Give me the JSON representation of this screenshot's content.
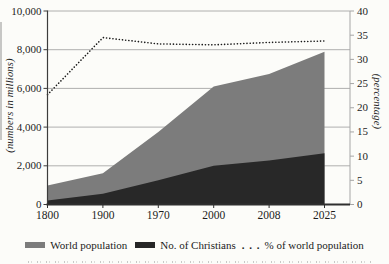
{
  "figure": {
    "legend": {
      "items": [
        {
          "label": "World population"
        },
        {
          "label": "No. of Christians"
        },
        {
          "marker": ". . .",
          "label": "% of world population"
        }
      ]
    }
  },
  "chart_data": {
    "type": "area",
    "title": "",
    "categories": [
      "1800",
      "1900",
      "1970",
      "2000",
      "2008",
      "2025"
    ],
    "series": [
      {
        "name": "World population",
        "type": "area",
        "axis": "left",
        "color": "#7c7c7c",
        "values": [
          980,
          1620,
          3750,
          6100,
          6750,
          7900
        ]
      },
      {
        "name": "No. of Christians",
        "type": "area",
        "axis": "left",
        "color": "#282828",
        "values": [
          205,
          560,
          1250,
          2000,
          2270,
          2650
        ]
      },
      {
        "name": "% of world population",
        "type": "dotted-line",
        "axis": "right",
        "color": "#1a1a1a",
        "values": [
          22.7,
          34.5,
          33.2,
          33.0,
          33.5,
          33.8
        ]
      }
    ],
    "left_axis": {
      "title": "(numbers in millions)",
      "min": 0,
      "max": 10000,
      "tick_step": 2000,
      "tick_labels": [
        "0",
        "2,000",
        "4,000",
        "6,000",
        "8,000",
        "10,000"
      ]
    },
    "right_axis": {
      "title": "(percentage)",
      "min": 0,
      "max": 40,
      "tick_step": 5,
      "tick_labels": [
        "0",
        "5",
        "10",
        "15",
        "20",
        "25",
        "30",
        "35",
        "40"
      ]
    },
    "grid": "horizontal gridlines at left-axis steps of 2,000",
    "legend_position": "bottom"
  }
}
